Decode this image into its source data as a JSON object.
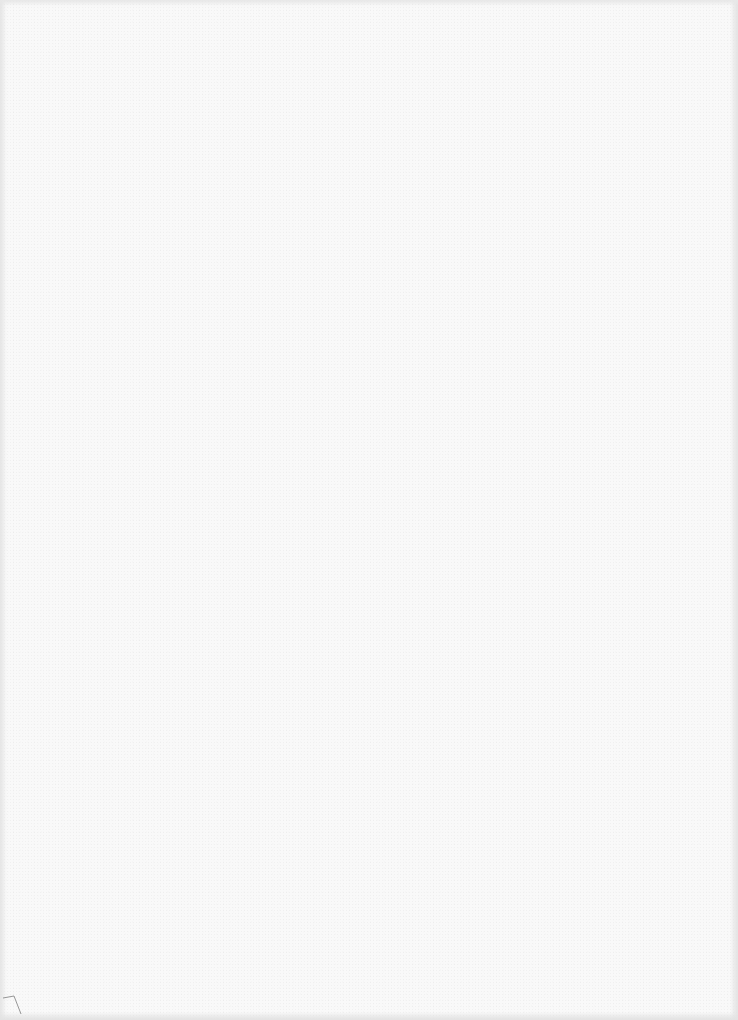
{
  "page": {
    "type": "blank-scanned-page",
    "background_color": "#f9f9f9",
    "edge_color": "#e4e4e4",
    "text_content": "",
    "corner_mark": {
      "position": "bottom-left",
      "color": "#8a8a8a"
    }
  }
}
